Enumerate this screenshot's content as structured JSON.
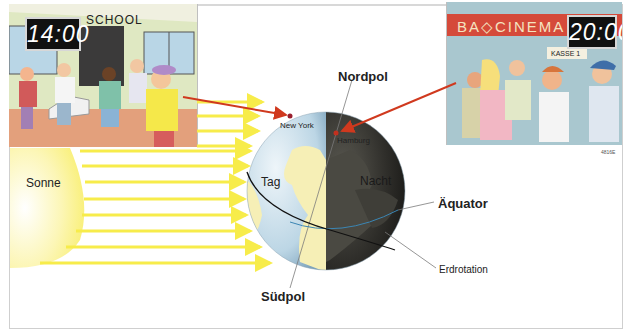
{
  "diagram": {
    "topic": "Tag und Nacht",
    "labels": {
      "sun": "Sonne",
      "north_pole": "Nordpol",
      "south_pole": "Südpol",
      "equator": "Äquator",
      "rotation": "Erdrotation",
      "day": "Tag",
      "night": "Nacht",
      "city_west": "New York",
      "city_east": "Hamburg"
    },
    "scenes": {
      "left": {
        "sign": "SCHOOL",
        "clock": "14:00"
      },
      "right": {
        "sign": "CINEMA",
        "box_office": "KASSE 1",
        "clock": "20:00"
      }
    },
    "image_code": "4816E",
    "colors": {
      "sun": "#fbf07a",
      "rays": "#f7ec4a",
      "arrow": "#d0391e",
      "day_ocean": "#c7dde9",
      "night_side": "#2c2b28",
      "land_day": "#f6efb6",
      "equator_line": "#3b86b4"
    }
  }
}
